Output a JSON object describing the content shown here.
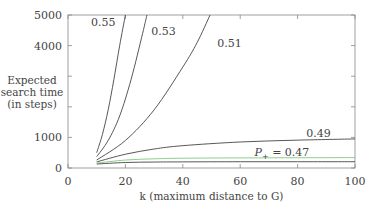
{
  "chart_data": {
    "type": "line",
    "title": "",
    "xlabel": "k (maximum distance to G)",
    "ylabel": [
      "Expected",
      "search time",
      "(in steps)"
    ],
    "xlim": [
      0,
      100
    ],
    "ylim": [
      0,
      5000
    ],
    "x_ticks": [
      0,
      20,
      40,
      60,
      80,
      100
    ],
    "y_ticks": [
      0,
      1000,
      2000,
      3000,
      4000,
      5000
    ],
    "y_tick_labels": [
      "0",
      "1000",
      "",
      "",
      "4000",
      "5000"
    ],
    "grid": false,
    "series": [
      {
        "name": "0.55",
        "label": "0.55",
        "color": "#444444",
        "x": [
          10,
          12,
          14,
          16,
          18,
          20
        ],
        "y": [
          500,
          1100,
          1900,
          2900,
          4000,
          5000
        ]
      },
      {
        "name": "0.53",
        "label": "0.53",
        "color": "#444444",
        "x": [
          10,
          14,
          18,
          22,
          26,
          27.5
        ],
        "y": [
          370,
          900,
          1700,
          2900,
          4400,
          5000
        ]
      },
      {
        "name": "0.51",
        "label": "0.51",
        "color": "#444444",
        "x": [
          10,
          20,
          30,
          40,
          45,
          49.5
        ],
        "y": [
          260,
          900,
          1900,
          3300,
          4100,
          5000
        ]
      },
      {
        "name": "0.49",
        "label": "0.49",
        "color": "#444444",
        "x": [
          10,
          20,
          30,
          40,
          60,
          80,
          100
        ],
        "y": [
          200,
          450,
          620,
          730,
          850,
          910,
          950
        ]
      },
      {
        "name": "0.47",
        "label": "P+ = 0.47",
        "color": "#7ec87e",
        "x": [
          10,
          20,
          30,
          40,
          60,
          80,
          100
        ],
        "y": [
          160,
          260,
          300,
          320,
          330,
          335,
          340
        ]
      },
      {
        "name": "0.45",
        "label": "",
        "color": "#444444",
        "x": [
          10,
          20,
          30,
          40,
          60,
          80,
          100
        ],
        "y": [
          130,
          180,
          195,
          200,
          205,
          205,
          205
        ]
      }
    ],
    "annotations": [
      {
        "text": "0.55",
        "x": 8,
        "y": 4650
      },
      {
        "text": "0.53",
        "x": 29,
        "y": 4350
      },
      {
        "text": "0.51",
        "x": 52,
        "y": 3950
      },
      {
        "text": "0.49",
        "x": 83,
        "y": 1000
      },
      {
        "text": "P+ = 0.47",
        "x": 65,
        "y": 400
      }
    ]
  }
}
